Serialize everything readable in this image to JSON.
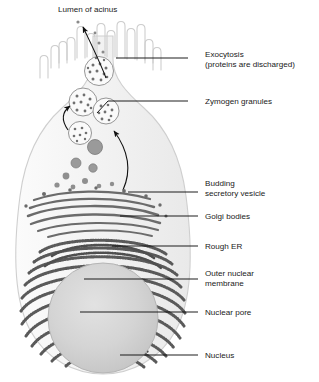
{
  "diagram": {
    "title": "Lumen of acinus",
    "colors": {
      "cell_fill": "#f2f2f2",
      "cell_outline": "#cfcfcf",
      "nucleus_fill": "#d2d2d2",
      "nucleus_edge": "#b5b5b5",
      "organelle_dark": "#6b6b6b",
      "rough_er": "#5a5a5a",
      "text": "#1a1a1a",
      "leader_line": "#111111",
      "arrow": "#111111"
    },
    "labels": [
      {
        "id": "exocytosis",
        "text": "Exocytosis\n(proteins are discharged)",
        "x": 205,
        "y": 53,
        "leader_x1": 188,
        "leader_x2": 116,
        "leader_y": 58
      },
      {
        "id": "zymogen-granules",
        "text": "Zymogen granules",
        "x": 205,
        "y": 98,
        "leader_x1": 188,
        "leader_x2": 108,
        "leader_y": 101
      },
      {
        "id": "budding-secretory-vesicle",
        "text": "Budding\nsecretory vesicle",
        "x": 205,
        "y": 170,
        "leader_x1": 198,
        "leader_x2": 128,
        "leader_y": 192
      },
      {
        "id": "golgi-bodies",
        "text": "Golgi bodies",
        "x": 205,
        "y": 213,
        "leader_x1": 198,
        "leader_x2": 120,
        "leader_y": 216
      },
      {
        "id": "rough-er",
        "text": "Rough ER",
        "x": 205,
        "y": 243,
        "leader_x1": 198,
        "leader_x2": 112,
        "leader_y": 246
      },
      {
        "id": "outer-nuclear-membrane",
        "text": "Outer nuclear\nmembrane",
        "x": 205,
        "y": 275,
        "leader_x1": 198,
        "leader_x2": 84,
        "leader_y": 279
      },
      {
        "id": "nuclear-pore",
        "text": "Nuclear pore",
        "x": 205,
        "y": 309,
        "leader_x1": 198,
        "leader_x2": 80,
        "leader_y": 312
      },
      {
        "id": "nucleus",
        "text": "Nucleus",
        "x": 205,
        "y": 352,
        "leader_x1": 198,
        "leader_x2": 120,
        "leader_y": 355
      }
    ],
    "structures": {
      "microvilli_count": 11,
      "granule_chain": [
        {
          "cx": 99,
          "cy": 71,
          "r": 14.5
        },
        {
          "cx": 83,
          "cy": 102,
          "r": 14.0
        },
        {
          "cx": 106,
          "cy": 111,
          "r": 13.0
        },
        {
          "cx": 80,
          "cy": 133,
          "r": 11.5
        },
        {
          "cx": 95,
          "cy": 147,
          "r": 7.5
        },
        {
          "cx": 76,
          "cy": 163,
          "r": 5.0
        },
        {
          "cx": 93,
          "cy": 168,
          "r": 4.2
        },
        {
          "cx": 66,
          "cy": 176,
          "r": 3.4
        },
        {
          "cx": 85,
          "cy": 181,
          "r": 3.0
        }
      ],
      "nucleus": {
        "cx": 103,
        "cy": 318,
        "r": 55
      },
      "golgi_stacks": 6,
      "rough_er_strands": 22
    },
    "annotations": {
      "secretion_arrow_lower": "curved arrow from Golgi region up to granules",
      "secretion_arrow_upper": "curved arrow from apex granule into lumen",
      "budding_arrow": "short arrow pointing to budding vesicle"
    }
  }
}
